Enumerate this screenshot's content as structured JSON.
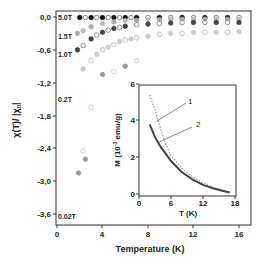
{
  "chart_data": [
    {
      "type": "scatter",
      "title": "",
      "xlabel": "Temperature (K)",
      "ylabel": "χ(T)/ |χ0|",
      "xlim": [
        0,
        17
      ],
      "ylim": [
        -3.7,
        0.1
      ],
      "xticks": [
        "0",
        "4",
        "8",
        "12",
        "16"
      ],
      "yticks": [
        "0,0",
        "-0,6",
        "-1,2",
        "-1,8",
        "-2,4",
        "-3,0",
        "-3,6"
      ],
      "grid": false,
      "annotations": [
        "5.0T",
        "1.5T",
        "1.0T",
        "0.2T",
        "0.02T"
      ],
      "series": [
        {
          "name": "5.0T",
          "x": [
            2,
            2.5,
            3,
            3.5,
            4,
            4.5,
            5,
            5.5,
            6,
            6.5,
            7,
            8,
            9,
            10,
            11,
            12,
            13,
            14,
            15,
            16
          ],
          "y": [
            -0.01,
            -0.01,
            -0.01,
            -0.01,
            -0.01,
            -0.01,
            -0.01,
            -0.01,
            -0.01,
            -0.01,
            -0.01,
            -0.01,
            -0.01,
            -0.01,
            -0.01,
            -0.01,
            -0.01,
            -0.01,
            -0.01,
            -0.01
          ]
        },
        {
          "name": "1.5T",
          "x": [
            1.8,
            2.3,
            3,
            4,
            5,
            6,
            7,
            8,
            9,
            10,
            11,
            12,
            13,
            14,
            15,
            16
          ],
          "y": [
            -0.3,
            -0.25,
            -0.18,
            -0.12,
            -0.09,
            -0.07,
            -0.06,
            -0.05,
            -0.05,
            -0.04,
            -0.04,
            -0.04,
            -0.04,
            -0.04,
            -0.04,
            -0.04
          ]
        },
        {
          "name": "1.0T",
          "x": [
            1.8,
            2.3,
            3,
            3.5,
            4,
            4.5,
            5,
            5.5,
            6,
            7,
            8,
            9,
            10,
            11,
            12,
            13,
            14,
            15,
            16
          ],
          "y": [
            -0.6,
            -0.52,
            -0.4,
            -0.33,
            -0.28,
            -0.24,
            -0.21,
            -0.19,
            -0.17,
            -0.14,
            -0.13,
            -0.12,
            -0.11,
            -0.1,
            -0.1,
            -0.1,
            -0.1,
            -0.1,
            -0.1
          ]
        },
        {
          "name": "0.2T",
          "x": [
            2.3,
            3,
            3.5,
            4,
            4.5,
            5,
            5.5,
            6,
            6.5,
            7,
            8,
            9,
            10,
            11,
            12,
            13,
            14,
            15,
            16
          ],
          "y": [
            -0.95,
            -0.8,
            -0.68,
            -0.6,
            -0.55,
            -0.5,
            -0.45,
            -0.42,
            -0.4,
            -0.38,
            -0.35,
            -0.32,
            -0.3,
            -0.3,
            -0.28,
            -0.28,
            -0.28,
            -0.28,
            -0.27
          ]
        },
        {
          "name": "0.02T",
          "x": [
            1.9,
            2.3,
            2.5,
            3,
            4,
            5,
            6,
            7
          ],
          "y": [
            -2.85,
            -2.45,
            -2.6,
            -1.65,
            -1.05,
            -1.0,
            -0.9,
            -0.8
          ]
        }
      ]
    },
    {
      "type": "line",
      "title": "",
      "xlabel": "T (K)",
      "ylabel": "M (10^-3 emu/g)",
      "xlim": [
        0,
        18
      ],
      "ylim": [
        0,
        6
      ],
      "xticks": [
        "0",
        "6",
        "12",
        "18"
      ],
      "yticks": [
        "0",
        "2",
        "4",
        "6"
      ],
      "grid": false,
      "series": [
        {
          "name": "1",
          "x": [
            2,
            3,
            4,
            5,
            6,
            8,
            10,
            12,
            14,
            16,
            17
          ],
          "y": [
            5.4,
            4.6,
            3.6,
            2.7,
            2.1,
            1.4,
            0.95,
            0.6,
            0.35,
            0.18,
            0.1
          ]
        },
        {
          "name": "2",
          "x": [
            2,
            3,
            4,
            5,
            6,
            8,
            10,
            12,
            14,
            16,
            17
          ],
          "y": [
            3.8,
            3.1,
            2.6,
            2.2,
            1.8,
            1.2,
            0.8,
            0.5,
            0.3,
            0.15,
            0.08
          ]
        }
      ],
      "annotations": [
        "1",
        "2"
      ]
    }
  ],
  "labels": {
    "main_xlabel": "Temperature (K)",
    "main_ylabel": "χ(T)/ |χ",
    "main_ylabel_sub": "0",
    "main_ylabel_end": "|",
    "inset_xlabel": "T (K)",
    "inset_ylabel": "M (10",
    "inset_ylabel_sup": "-3",
    "inset_ylabel_end": " emu/g)",
    "field_5T": "5.0T",
    "field_15T": "1.5T",
    "field_1T": "1.0T",
    "field_02T": "0.2T",
    "field_002T": "0.02T",
    "curve1": "1",
    "curve2": "2"
  },
  "ticks": {
    "main_x": [
      "0",
      "4",
      "8",
      "12",
      "16"
    ],
    "main_y": [
      "0,0",
      "-0,6",
      "-1,2",
      "-1,8",
      "-2,4",
      "-3,0",
      "-3,6"
    ],
    "inset_x": [
      "0",
      "6",
      "12",
      "18"
    ],
    "inset_y": [
      "0",
      "2",
      "4",
      "6"
    ]
  }
}
